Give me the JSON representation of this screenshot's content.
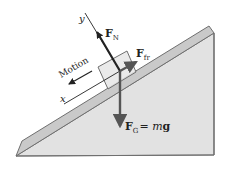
{
  "figure": {
    "colors": {
      "incline_side": "#e2e2e2",
      "incline_top": "#c9c9c9",
      "outline": "#6f6f6f",
      "block_fill": "#e6e6e6",
      "vector": "#555555",
      "text": "#222222"
    },
    "axes": {
      "x_label": "x",
      "y_label": "y"
    },
    "motion_label": "Motion",
    "forces": {
      "normal": {
        "symbol": "F",
        "subscript": "N"
      },
      "friction": {
        "symbol": "F",
        "subscript": "fr"
      },
      "gravity": {
        "symbol": "F",
        "subscript": "G",
        "equals": "= ",
        "m": "m",
        "g": "g"
      }
    }
  }
}
